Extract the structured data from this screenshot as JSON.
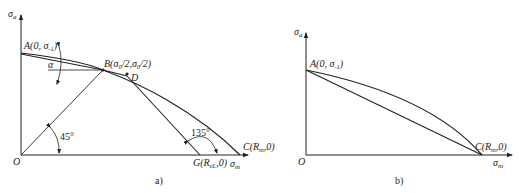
{
  "diagram_a": {
    "caption": "a)",
    "y_axis_label": "σ",
    "y_axis_sub": "a",
    "x_axis_label": "σ",
    "x_axis_sub": "m",
    "origin_label": "O",
    "point_A": "A(0, σ",
    "point_A_sub": "-1",
    "point_A_close": ")",
    "point_B": "B(σ",
    "point_B_sub1": "0",
    "point_B_mid": "/2,σ",
    "point_B_sub2": "0",
    "point_B_close": "/2)",
    "point_D": "D",
    "point_C": "C(R",
    "point_C_sub": "m",
    "point_C_close": ",0)",
    "point_G": "G(R",
    "point_G_sub": "eL",
    "point_G_close": ",0)",
    "angle_alpha": "α",
    "angle_45": "45°",
    "angle_135": "135°"
  },
  "diagram_b": {
    "caption": "b)",
    "y_axis_label": "σ",
    "y_axis_sub": "a",
    "x_axis_label": "σ",
    "x_axis_sub": "m",
    "origin_label": "O",
    "point_A": "A(0, σ",
    "point_A_sub": "-1",
    "point_A_close": ")",
    "point_C": "C(R",
    "point_C_sub": "m",
    "point_C_close": ",0)"
  }
}
